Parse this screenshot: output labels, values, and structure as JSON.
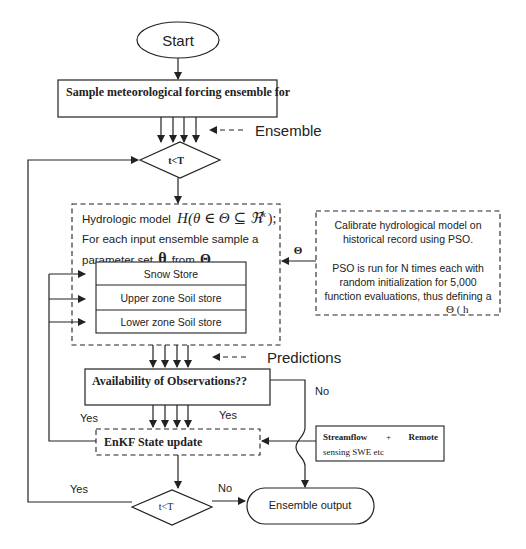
{
  "diagram": {
    "start": {
      "label": "Start"
    },
    "sample_box": {
      "label": "Sample meteorological forcing ensemble for"
    },
    "ensemble_note": {
      "label": "Ensemble"
    },
    "decision_top": {
      "label": "t<T"
    },
    "hydro_model": {
      "line1": "Hydrologic model",
      "formula": "H(θ ∈ Θ ⊆ ℜ",
      "formula_sup": "k",
      "formula_end": ");",
      "line2": "For each input ensemble sample a",
      "line3_pre": "parameter set",
      "line3_theta": "θ",
      "line3_mid": "from",
      "line3_Theta": "Θ",
      "stores": [
        "Snow Store",
        "Upper zone Soil store",
        "Lower zone Soil store"
      ]
    },
    "theta_arrow": {
      "label": "Θ"
    },
    "pso_box": {
      "lines": [
        "Calibrate hydrological model on",
        "historical record using PSO.",
        "",
        "PSO is run for N times each with",
        "random initialization for 5,000",
        "function evaluations, thus defining a"
      ],
      "last_line": "Θ ( h"
    },
    "predictions_note": {
      "label": "Predictions"
    },
    "availability": {
      "label": "Availability of Observations??"
    },
    "labels": {
      "no_top": "No",
      "yes_left": "Yes",
      "yes_right": "Yes",
      "yes_bottom": "Yes",
      "no_bottom": "No"
    },
    "enkf": {
      "label": "EnKF State update"
    },
    "streamflow": {
      "line1_a": "Streamflow",
      "line1_b": "+",
      "line1_c": "Remote",
      "line2": "sensing SWE  etc"
    },
    "decision_bottom": {
      "label": "t<T"
    },
    "ensemble_output": {
      "label": "Ensemble output"
    }
  }
}
